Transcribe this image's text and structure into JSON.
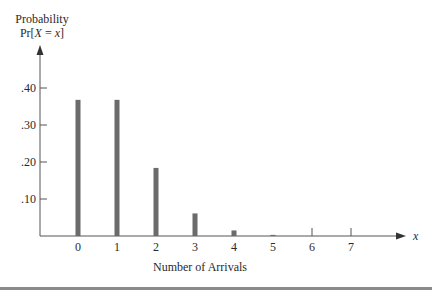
{
  "chart_data": {
    "type": "bar",
    "title": "",
    "ylabel_line1": "Probability",
    "ylabel_line2_prefix": "Pr[",
    "ylabel_line2_var": "X",
    "ylabel_line2_mid": " = ",
    "ylabel_line2_val": "x",
    "ylabel_line2_suffix": "]",
    "xlabel": "Number of Arrivals",
    "x_axis_symbol": "x",
    "categories": [
      "0",
      "1",
      "2",
      "3",
      "4",
      "5",
      "6",
      "7"
    ],
    "values": [
      0.368,
      0.368,
      0.184,
      0.061,
      0.015,
      0.003,
      0.0,
      0.0
    ],
    "yticks": [
      {
        "value": 0.1,
        "label": ".10"
      },
      {
        "value": 0.2,
        "label": ".20"
      },
      {
        "value": 0.3,
        "label": ".30"
      },
      {
        "value": 0.4,
        "label": ".40"
      }
    ],
    "ylim": [
      0,
      0.45
    ],
    "grid": false,
    "legend": null,
    "bar_color": "#6b6b6b"
  },
  "colors": {
    "axis": "#555555",
    "bar": "#6b6b6b",
    "text": "#2a2a2a",
    "rule": "#777777"
  }
}
